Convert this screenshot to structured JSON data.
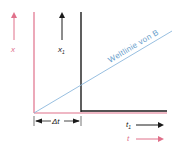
{
  "diagram": {
    "labels": {
      "x": "x",
      "x1": "x",
      "x1_sub": "1",
      "t": "t",
      "t1": "t",
      "t1_sub": "1",
      "delta_t": "Δt",
      "worldline": "Weltlinie von B"
    },
    "colors": {
      "red": "#e0708a",
      "black": "#1a1a1a",
      "blue": "#8cb8dc",
      "worldline_text": "#6aa0cc"
    }
  }
}
